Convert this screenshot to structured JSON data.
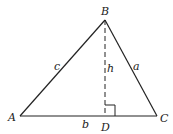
{
  "diagram": {
    "type": "triangle-with-altitude",
    "colors": {
      "stroke": "#222222",
      "background": "#ffffff"
    },
    "vertices": {
      "A": {
        "label": "A",
        "x": 20,
        "y": 116
      },
      "B": {
        "label": "B",
        "x": 105,
        "y": 20
      },
      "C": {
        "label": "C",
        "x": 157,
        "y": 116
      },
      "D": {
        "label": "D",
        "x": 105,
        "y": 116
      }
    },
    "sides": {
      "a": {
        "label": "a",
        "from": "B",
        "to": "C"
      },
      "b": {
        "label": "b",
        "from": "A",
        "to": "C"
      },
      "c": {
        "label": "c",
        "from": "A",
        "to": "B"
      }
    },
    "altitude": {
      "label": "h",
      "from": "B",
      "to": "D",
      "style": "dashed"
    },
    "right_angle_marker": {
      "at": "D",
      "size": 10
    }
  }
}
